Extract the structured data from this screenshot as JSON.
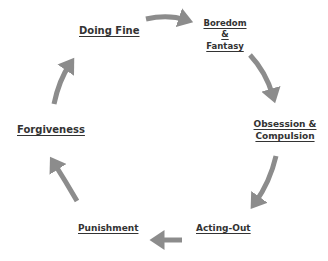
{
  "diagram": {
    "type": "cycle",
    "arrow_color": "#8c8c8c",
    "text_color": "#333333",
    "stages": [
      {
        "id": "doing-fine",
        "label": "Doing Fine"
      },
      {
        "id": "boredom-fantasy",
        "line1": "Boredom",
        "line2": "&",
        "line3": "Fantasy"
      },
      {
        "id": "obsession-compulsion",
        "line1": "Obsession &",
        "line2": "Compulsion"
      },
      {
        "id": "acting-out",
        "label": "Acting-Out"
      },
      {
        "id": "punishment",
        "label": "Punishment"
      },
      {
        "id": "forgiveness",
        "label": "Forgiveness"
      }
    ],
    "edges": [
      {
        "from": "doing-fine",
        "to": "boredom-fantasy"
      },
      {
        "from": "boredom-fantasy",
        "to": "obsession-compulsion"
      },
      {
        "from": "obsession-compulsion",
        "to": "acting-out"
      },
      {
        "from": "acting-out",
        "to": "punishment"
      },
      {
        "from": "punishment",
        "to": "forgiveness"
      },
      {
        "from": "forgiveness",
        "to": "doing-fine"
      }
    ]
  }
}
